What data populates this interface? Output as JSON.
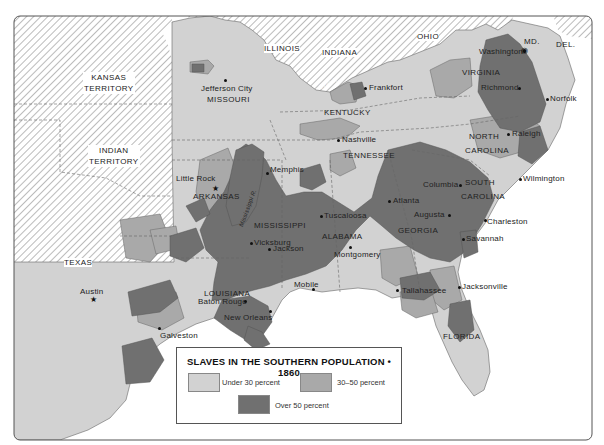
{
  "legend": {
    "title": "SLAVES IN THE SOUTHERN POPULATION • 1860",
    "items": [
      {
        "label": "Under 30 percent",
        "color": "#d2d2d2"
      },
      {
        "label": "30–50 percent",
        "color": "#a9a9a9"
      },
      {
        "label": "Over 50 percent",
        "color": "#707070"
      }
    ]
  },
  "colors": {
    "water": "#ffffff",
    "territory_hatch": "#ffffff",
    "under30": "#d2d2d2",
    "mid": "#a9a9a9",
    "over50": "#707070",
    "border": "#666666"
  },
  "territories": {
    "kansas_1": "KANSAS",
    "kansas_2": "TERRITORY",
    "indian_1": "INDIAN",
    "indian_2": "TERRITORY"
  },
  "states": {
    "illinois": "ILLINOIS",
    "indiana": "INDIANA",
    "ohio": "OHIO",
    "md": "MD.",
    "del": "DEL.",
    "missouri": "MISSOURI",
    "kentucky": "KENTUCKY",
    "virginia": "VIRGINIA",
    "tennessee": "TENNESSEE",
    "north_carolina_1": "NORTH",
    "north_carolina_2": "CAROLINA",
    "south_carolina_1": "SOUTH",
    "south_carolina_2": "CAROLINA",
    "arkansas": "ARKANSAS",
    "mississippi": "MISSISSIPPI",
    "alabama": "ALABAMA",
    "georgia": "GEORGIA",
    "louisiana": "LOUISIANA",
    "texas": "TEXAS",
    "florida": "FLORIDA"
  },
  "rivers": {
    "ohio": "Ohio R.",
    "mississippi": "Mississippi R."
  },
  "cities": {
    "jefferson_city": "Jefferson City",
    "frankfort": "Frankfort",
    "washington": "Washington",
    "richmond": "Richmond",
    "norfolk": "Norfolk",
    "nashville": "Nashville",
    "raleigh": "Raleigh",
    "little_rock": "Little Rock",
    "memphis": "Memphis",
    "wilmington": "Wilmington",
    "columbia": "Columbia",
    "atlanta": "Atlanta",
    "tuscaloosa": "Tuscaloosa",
    "augusta": "Augusta",
    "charleston": "Charleston",
    "vicksburg": "Vicksburg",
    "jackson": "Jackson",
    "montgomery": "Montgomery",
    "savannah": "Savannah",
    "austin": "Austin",
    "mobile": "Mobile",
    "tallahassee": "Tallahassee",
    "jacksonville": "Jacksonville",
    "baton_rouge": "Baton Rouge",
    "new_orleans": "New Orleans",
    "galveston": "Galveston"
  }
}
